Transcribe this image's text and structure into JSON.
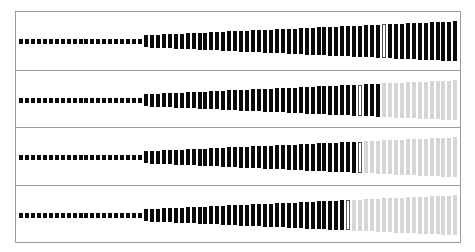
{
  "frame": {
    "left": 15,
    "top": 11,
    "width": 446,
    "height": 232,
    "border_color": "#9a9a9a"
  },
  "colors": {
    "filled": "#0a0a0a",
    "empty": "#d6d6d6",
    "thumb_border": "#555555"
  },
  "bars": {
    "count": 74,
    "start_x": 3,
    "pitch": 5.95,
    "bar_width": 4,
    "small_count": 21,
    "small_height": 5,
    "min_tall_height": 12,
    "max_height": 40
  },
  "panels": [
    {
      "id": "panel-1",
      "top": 0,
      "height": 58,
      "center_y": 29,
      "thumb_index": 61,
      "filled_through": 73
    },
    {
      "id": "panel-2",
      "top": 58,
      "height": 57,
      "center_y": 29,
      "thumb_index": 57,
      "filled_through": 60
    },
    {
      "id": "panel-3",
      "top": 115,
      "height": 58,
      "center_y": 29,
      "thumb_index": 57,
      "filled_through": 57
    },
    {
      "id": "panel-4",
      "top": 173,
      "height": 58,
      "center_y": 29,
      "thumb_index": 55,
      "filled_through": 55
    }
  ]
}
